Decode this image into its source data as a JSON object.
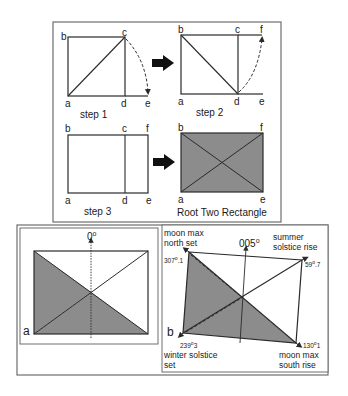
{
  "colors": {
    "line": "#2a2a2a",
    "fill": "#8c8c8c",
    "frame": "#6e6e6e",
    "background": "#ffffff"
  },
  "top_panel": {
    "step1": {
      "caption": "step 1",
      "points": {
        "a": "a",
        "b": "b",
        "c": "c",
        "d": "d",
        "e": "e"
      }
    },
    "step2": {
      "caption": "step 2",
      "points": {
        "a": "a",
        "b": "b",
        "c": "c",
        "d": "d",
        "e": "e",
        "f": "f"
      }
    },
    "step3": {
      "caption": "step 3",
      "points": {
        "a": "a",
        "b": "b",
        "c": "c",
        "d": "d",
        "e": "e",
        "f": "f"
      }
    },
    "result": {
      "caption": "Root Two Rectangle",
      "points": {
        "a": "a",
        "b": "b",
        "e": "e",
        "f": "f"
      }
    },
    "arrow_icon": "right-arrow"
  },
  "bottom_panel": {
    "left": {
      "panel_label": "a",
      "north_label": "0°",
      "north_main": "0",
      "north_deg": "o"
    },
    "right": {
      "panel_label": "b",
      "north_main": "005",
      "north_deg": "o",
      "corners": [
        {
          "id": "moon-max-north-set",
          "line1": "moon max",
          "line2": "north set",
          "bearing_int": "307",
          "bearing_frac": ".1"
        },
        {
          "id": "summer-solstice-rise",
          "line1": "summer",
          "line2": "solstice rise",
          "bearing_int": "59",
          "bearing_frac": ".7"
        },
        {
          "id": "winter-solstice-set",
          "line1": "winter solstice",
          "line2": "set",
          "bearing_int": "239",
          "bearing_frac": "3"
        },
        {
          "id": "moon-max-south-rise",
          "line1": "moon max",
          "line2": "south rise",
          "bearing_int": "130",
          "bearing_frac": "1"
        }
      ]
    }
  }
}
